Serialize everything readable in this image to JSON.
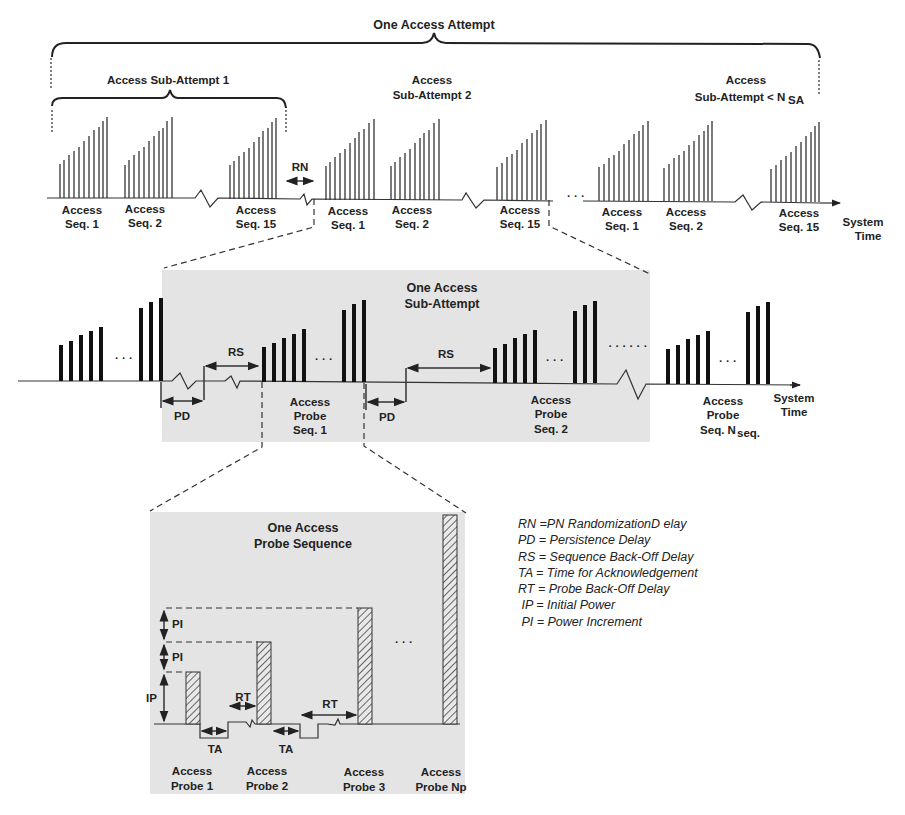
{
  "diagram": {
    "title": "One Access Attempt",
    "top_row": {
      "sub_attempt_1_label": "Access Sub-Attempt 1",
      "sub_attempt_2_label_line1": "Access",
      "sub_attempt_2_label_line2": "Sub-Attempt 2",
      "sub_attempt_n_label_line1": "Access",
      "sub_attempt_n_label_line2": "Sub-Attempt  < N",
      "sub_attempt_n_subscript": "SA",
      "rn_label": "RN",
      "sequences": [
        {
          "line1": "Access",
          "line2": "Seq. 1"
        },
        {
          "line1": "Access",
          "line2": "Seq. 2"
        },
        {
          "line1": "Access",
          "line2": "Seq. 15"
        },
        {
          "line1": "Access",
          "line2": "Seq. 1"
        },
        {
          "line1": "Access",
          "line2": "Seq. 2"
        },
        {
          "line1": "Access",
          "line2": "Seq. 15"
        },
        {
          "line1": "Access",
          "line2": "Seq. 1"
        },
        {
          "line1": "Access",
          "line2": "Seq. 2"
        },
        {
          "line1": "Access",
          "line2": "Seq. 15"
        }
      ],
      "ellipsis": "· · ·",
      "axis_label_line1": "System",
      "axis_label_line2": "Time"
    },
    "middle_row": {
      "title_line1": "One Access",
      "title_line2": "Sub-Attempt",
      "rs_label": "RS",
      "pd_label": "PD",
      "ellipsis": "· · ·",
      "long_ellipsis": "· · · · · ·",
      "probe_seqs": [
        {
          "line1": "Access",
          "line2": "Probe",
          "line3": "Seq. 1"
        },
        {
          "line1": "Access",
          "line2": "Probe",
          "line3": "Seq. 2"
        },
        {
          "line1": "Access",
          "line2": "Probe",
          "line3": "Seq. N",
          "subscript": "seq."
        }
      ],
      "axis_label_line1": "System",
      "axis_label_line2": "Time"
    },
    "bottom_panel": {
      "title_line1": "One Access",
      "title_line2": "Probe Sequence",
      "pi_label": "PI",
      "ip_label": "IP",
      "rt_label": "RT",
      "ta_label": "TA",
      "ellipsis": "· · ·",
      "probes": [
        {
          "line1": "Access",
          "line2": "Probe 1"
        },
        {
          "line1": "Access",
          "line2": "Probe 2"
        },
        {
          "line1": "Access",
          "line2": "Probe 3"
        },
        {
          "line1": "Access",
          "line2": "Probe Np"
        }
      ]
    },
    "legend": [
      "RN =PN RandomizationD elay",
      "PD = Persistence Delay",
      "RS = Sequence Back-Off Delay",
      "TA = Time for Acknowledgement",
      "RT = Probe Back-Off Delay",
      " IP = Initial Power",
      " PI = Power Increment"
    ],
    "colors": {
      "panel_gray": "#e4e4e4",
      "ink": "#222222",
      "hatch": "#555555"
    }
  }
}
